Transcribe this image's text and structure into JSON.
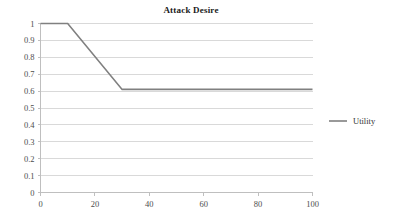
{
  "chart_data": {
    "type": "line",
    "title": "Attack Desire",
    "xlabel": "",
    "ylabel": "",
    "xlim": [
      0,
      100
    ],
    "ylim": [
      0,
      1
    ],
    "grid": true,
    "grid_axis": "y",
    "legend_position": "right",
    "x_ticks": [
      0,
      20,
      40,
      60,
      80,
      100
    ],
    "x_tick_labels": [
      "0",
      "20",
      "40",
      "60",
      "80",
      "100"
    ],
    "y_ticks": [
      0,
      0.1,
      0.2,
      0.3,
      0.4,
      0.5,
      0.6,
      0.7,
      0.8,
      0.9,
      1
    ],
    "y_tick_labels": [
      "0",
      "0.1",
      "0.2",
      "0.3",
      "0.4",
      "0.5",
      "0.6",
      "0.7",
      "0.8",
      "0.9",
      "1"
    ],
    "series": [
      {
        "name": "Utility",
        "color": "#808080",
        "x": [
          0,
          10,
          30,
          100
        ],
        "values": [
          1,
          1,
          0.61,
          0.61
        ]
      }
    ],
    "legend_entries": [
      "Utility"
    ]
  },
  "colors": {
    "background": "#ffffff",
    "gridline": "#d9d9d9",
    "axis": "#bfbfbf",
    "series_line": "#808080",
    "title_text": "#1a1a1a",
    "tick_text": "#4d4d4d",
    "legend_text": "#333333"
  }
}
